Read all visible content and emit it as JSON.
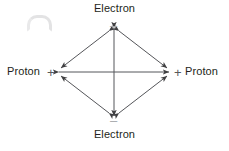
{
  "figure": {
    "title_visible": false,
    "background_color": "#ffffff",
    "line_color": "#4a4a4c",
    "text_color": "#231f20",
    "sign_plus_color": "#58595b",
    "sign_minus_color": "#a7a9ac"
  },
  "nodes": [
    {
      "id": "top",
      "label": "Electron",
      "charge": "–",
      "charge_name": "minus",
      "x": 114,
      "y": 26
    },
    {
      "id": "right",
      "label": "Proton",
      "charge": "+",
      "charge_name": "plus",
      "x": 172,
      "y": 72
    },
    {
      "id": "bottom",
      "label": "Electron",
      "charge": "–",
      "charge_name": "minus",
      "x": 114,
      "y": 118
    },
    {
      "id": "left",
      "label": "Proton",
      "charge": "+",
      "charge_name": "plus",
      "x": 56,
      "y": 72
    }
  ],
  "edges": [
    {
      "id": "top-left-edge",
      "from": "top",
      "to": "left",
      "arrows": "both"
    },
    {
      "id": "top-right-edge",
      "from": "top",
      "to": "right",
      "arrows": "both"
    },
    {
      "id": "bottom-left-edge",
      "from": "bottom",
      "to": "left",
      "arrows": "both"
    },
    {
      "id": "bottom-right-edge",
      "from": "bottom",
      "to": "right",
      "arrows": "both"
    },
    {
      "id": "horizontal-diagonal",
      "from": "left",
      "to": "right",
      "arrows": "both"
    },
    {
      "id": "vertical-diagonal",
      "from": "top",
      "to": "bottom",
      "arrows": "both"
    }
  ],
  "artifact": {
    "name": "gray-smudge-mark",
    "description": "faint light gray curved scan artifact"
  }
}
